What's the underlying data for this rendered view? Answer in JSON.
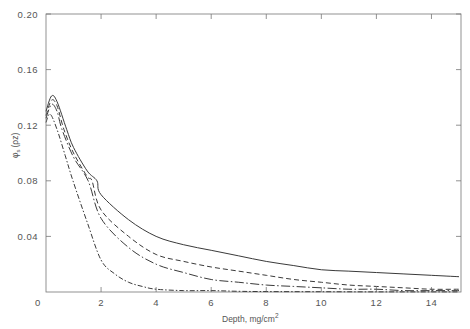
{
  "chart_data": {
    "type": "line",
    "title": "",
    "xlabel": "Depth, mg/cm²",
    "xlabel_main": "Depth, mg/cm",
    "xlabel_sup": "2",
    "ylabel": "φs(ρz)",
    "ylabel_main": "φ",
    "ylabel_sub": "s",
    "ylabel_arg": "(ρz)",
    "xlim": [
      0,
      15
    ],
    "ylim": [
      0,
      0.2
    ],
    "xticks": [
      0,
      2,
      4,
      6,
      8,
      10,
      12,
      14
    ],
    "xtick_labels": [
      "0",
      "2",
      "4",
      "6",
      "8",
      "10",
      "12",
      "14"
    ],
    "yticks": [
      0.04,
      0.08,
      0.12,
      0.16,
      0.2
    ],
    "ytick_labels": [
      "0.04",
      "0.08",
      "0.12",
      "0.16",
      "0.20"
    ],
    "grid": false,
    "legend": null,
    "series": [
      {
        "name": "solid",
        "style": "solid",
        "x": [
          0,
          0.2,
          0.4,
          0.75,
          1.0,
          1.5,
          1.85,
          2,
          3,
          4,
          5,
          6,
          7,
          8,
          9,
          10,
          11,
          12,
          13,
          14,
          15
        ],
        "y": [
          0.13,
          0.141,
          0.137,
          0.117,
          0.104,
          0.087,
          0.08,
          0.07,
          0.052,
          0.04,
          0.034,
          0.03,
          0.026,
          0.022,
          0.019,
          0.016,
          0.015,
          0.014,
          0.013,
          0.012,
          0.011
        ]
      },
      {
        "name": "dashed",
        "style": "dashed",
        "x": [
          0,
          0.2,
          0.4,
          0.65,
          1.0,
          1.5,
          1.67,
          2,
          3,
          4,
          5,
          6,
          7,
          8,
          9,
          10,
          11,
          12,
          13,
          14,
          15
        ],
        "y": [
          0.127,
          0.138,
          0.134,
          0.117,
          0.1,
          0.083,
          0.08,
          0.059,
          0.04,
          0.027,
          0.022,
          0.018,
          0.015,
          0.012,
          0.009,
          0.007,
          0.005,
          0.004,
          0.003,
          0.002,
          0.002
        ]
      },
      {
        "name": "long-dash-dot",
        "style": "dashdot-long",
        "x": [
          0,
          0.2,
          0.4,
          0.58,
          1.0,
          1.53,
          2,
          3,
          4,
          5,
          6,
          7,
          8,
          9,
          10,
          11,
          12,
          13,
          14,
          15
        ],
        "y": [
          0.125,
          0.135,
          0.13,
          0.117,
          0.097,
          0.08,
          0.053,
          0.032,
          0.02,
          0.014,
          0.009,
          0.007,
          0.005,
          0.004,
          0.003,
          0.002,
          0.002,
          0.001,
          0.001,
          0.001
        ]
      },
      {
        "name": "short-dash-dot",
        "style": "dashdot-short",
        "x": [
          0,
          0.15,
          0.4,
          0.7,
          0.98,
          1.5,
          2,
          2.5,
          3,
          3.5,
          4,
          5,
          6,
          7,
          8,
          10,
          12,
          14,
          15
        ],
        "y": [
          0.122,
          0.128,
          0.117,
          0.098,
          0.08,
          0.05,
          0.023,
          0.013,
          0.007,
          0.004,
          0.002,
          0.001,
          0.001,
          0.0005,
          0.0003,
          0.0002,
          0.0001,
          0.0001,
          0.0001
        ]
      }
    ]
  },
  "plot_area": {
    "left": 46,
    "top": 14,
    "right": 459,
    "bottom": 292
  },
  "colors": {
    "line": "#3a3a3a",
    "axis": "#777777",
    "text": "#555555",
    "background": "#ffffff"
  }
}
